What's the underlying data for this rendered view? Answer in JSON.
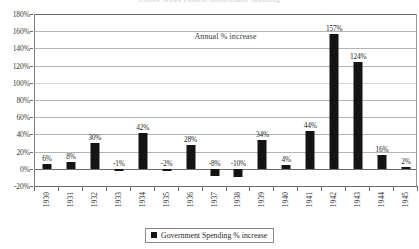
{
  "scan_artifact": {
    "clipped_text": "United States Federal Government Spending"
  },
  "chart_data": {
    "type": "bar",
    "title": "",
    "annotation": "Annual % increase",
    "legend": [
      {
        "label": "Government Spending % increase",
        "color": "#141414"
      }
    ],
    "legend_position": "bottom-center",
    "grid": true,
    "xlabel": "",
    "ylabel": "",
    "ylim": [
      -20,
      180
    ],
    "ytick_step": 20,
    "ytick_labels": [
      "180%",
      "160%",
      "140%",
      "120%",
      "100%",
      "80%",
      "60%",
      "40%",
      "20%",
      "0%",
      "-20%"
    ],
    "ytick_values": [
      180,
      160,
      140,
      120,
      100,
      80,
      60,
      40,
      20,
      0,
      -20
    ],
    "categories": [
      "1930",
      "1931",
      "1932",
      "1933",
      "1934",
      "1935",
      "1936",
      "1937",
      "1938",
      "1939",
      "1940",
      "1941",
      "1942",
      "1943",
      "1944",
      "1945"
    ],
    "values": [
      6,
      8,
      30,
      -1,
      42,
      -2,
      28,
      -8,
      -10,
      34,
      4,
      44,
      157,
      124,
      16,
      2
    ],
    "data_labels": [
      "6%",
      "8%",
      "30%",
      "-1%",
      "42%",
      "-2%",
      "28%",
      "-8%",
      "-10%",
      "34%",
      "4%",
      "44%",
      "157%",
      "124%",
      "16%",
      "2%"
    ],
    "bar_color": "#141414",
    "grid_color": "#b4b4b4",
    "axis_color": "#6d6d6d"
  }
}
